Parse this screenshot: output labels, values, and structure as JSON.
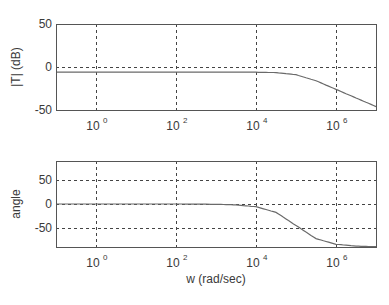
{
  "colors": {
    "background": "#ffffff",
    "axes": "#555555",
    "grid": "#444444",
    "curve": "#6a6a6a",
    "text": "#3a3a3a"
  },
  "chart_data": [
    {
      "type": "line",
      "title": "",
      "xlabel": "",
      "ylabel": "|T| (dB)",
      "xscale": "log",
      "xlim": [
        0.1,
        10000000
      ],
      "ylim": [
        -50,
        50
      ],
      "grid": true,
      "xticks": [
        1,
        100,
        10000,
        1000000
      ],
      "xtick_labels": [
        {
          "base": "10",
          "exp": "0"
        },
        {
          "base": "10",
          "exp": "2"
        },
        {
          "base": "10",
          "exp": "4"
        },
        {
          "base": "10",
          "exp": "6"
        }
      ],
      "yticks": [
        50,
        0,
        -50
      ],
      "ytick_labels": [
        "50",
        "0",
        "-50"
      ],
      "series": [
        {
          "name": "magnitude",
          "x": [
            0.1,
            1,
            10,
            100,
            1000,
            10000,
            31623,
            100000,
            316228,
            1000000,
            3162278,
            10000000
          ],
          "values": [
            -6,
            -6,
            -6,
            -6,
            -6,
            -6.1,
            -6.5,
            -9,
            -16,
            -26,
            -36,
            -46
          ]
        }
      ]
    },
    {
      "type": "line",
      "title": "",
      "xlabel": "w (rad/sec)",
      "ylabel": "angle",
      "xscale": "log",
      "xlim": [
        0.1,
        10000000
      ],
      "ylim": [
        -90,
        90
      ],
      "grid": true,
      "xticks": [
        1,
        100,
        10000,
        1000000
      ],
      "xtick_labels": [
        {
          "base": "10",
          "exp": "0"
        },
        {
          "base": "10",
          "exp": "2"
        },
        {
          "base": "10",
          "exp": "4"
        },
        {
          "base": "10",
          "exp": "6"
        }
      ],
      "yticks": [
        50,
        0,
        -50
      ],
      "ytick_labels": [
        "50",
        "0",
        "-50"
      ],
      "series": [
        {
          "name": "phase",
          "x": [
            0.1,
            1,
            10,
            100,
            1000,
            3162,
            10000,
            31623,
            100000,
            316228,
            1000000,
            3162278,
            10000000
          ],
          "values": [
            0,
            0,
            0,
            0,
            -0.6,
            -1.8,
            -5.7,
            -17.5,
            -45,
            -72.5,
            -84.3,
            -88.2,
            -89.4
          ]
        }
      ]
    }
  ]
}
